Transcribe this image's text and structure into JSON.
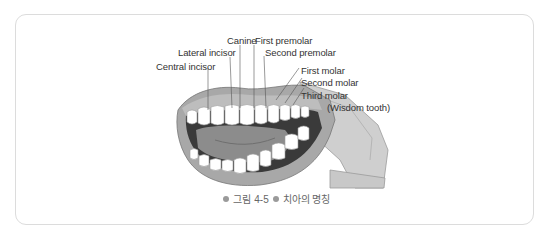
{
  "figure": {
    "labels": {
      "canine": "Canine",
      "first_premolar": "First premolar",
      "lateral_incisor": "Lateral incisor",
      "second_premolar": "Second premolar",
      "central_incisor": "Central incisor",
      "first_molar": "First molar",
      "second_molar": "Second molar",
      "third_molar": "Third molar",
      "wisdom_tooth": "(Wisdom tooth)"
    },
    "caption": {
      "number": "그림 4-5",
      "title": "치아의 명칭"
    }
  }
}
